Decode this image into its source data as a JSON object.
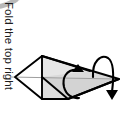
{
  "page": {
    "width": 121,
    "height": 132,
    "background": "#ffffff"
  },
  "caption": {
    "text": "Fold the top right",
    "orientation": "rotated-90-clockwise",
    "color": "#1d1d1d",
    "clipped": true
  },
  "decoration": {
    "corner_swoosh_color": "#c2c2c2"
  },
  "diagram": {
    "title": "Fold the top right",
    "type": "origami-fold-instruction",
    "line_color": "#000000",
    "fill_light": "#f2f2f2",
    "fill_mid": "#dcdcdc",
    "fill_dark": "#c9c9c9",
    "crease_color": "#9a9a9a",
    "arrow_color": "#000000",
    "shapes": [
      {
        "name": "left-point-upper-facet",
        "fill": "#ffffff",
        "points": "15,77 42,56 42,77"
      },
      {
        "name": "left-point-lower-facet",
        "fill": "#ffffff",
        "points": "15,77 42,77 42,99"
      },
      {
        "name": "upper-body-facet",
        "fill": "#e4e4e4",
        "points": "42,56 90,72 42,77"
      },
      {
        "name": "main-right-facet",
        "fill": "#d7d7d7",
        "points": "42,56 119,79 42,77"
      },
      {
        "name": "lower-body-facet",
        "fill": "#d2d2d2",
        "points": "42,77 119,79 68,99"
      },
      {
        "name": "bottom-left-facet",
        "fill": "#d9d9d9",
        "points": "42,77 68,99 42,99"
      }
    ],
    "creases": [
      {
        "name": "horizontal-center-crease",
        "from": "10,77",
        "to": "119,79"
      }
    ],
    "arrows": [
      {
        "name": "rotate-fold-arrow",
        "style": "curved-arrow-up",
        "direction": "counterclockwise-up"
      },
      {
        "name": "flip-over-loop-arrow",
        "style": "loop-arrow-down",
        "direction": "over-and-down"
      }
    ]
  }
}
